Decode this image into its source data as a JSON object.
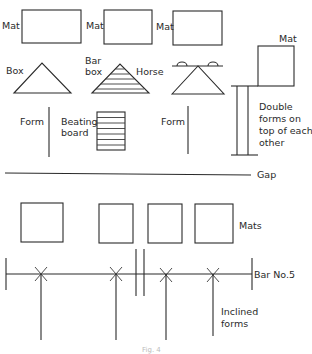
{
  "labels": {
    "mat1": "Mat",
    "mat2": "Mat",
    "mat3": "Mat",
    "mat4": "Mat",
    "box": "Box",
    "bar_box_line1": "Bar",
    "bar_box_line2": "box",
    "horse": "Horse",
    "form1": "Form",
    "beating_board_line1": "Beating",
    "beating_board_line2": "board",
    "form2": "Form",
    "double_forms": [
      "Double",
      "forms on",
      "top of each",
      "other"
    ],
    "gap": "Gap",
    "mats": "Mats",
    "bar_no": "Bar No.5",
    "inclined_forms": [
      "Inclined",
      "forms"
    ],
    "caption": "Fig. 4"
  },
  "colors": {
    "line": "#2a2a2a",
    "background": "#ffffff"
  }
}
